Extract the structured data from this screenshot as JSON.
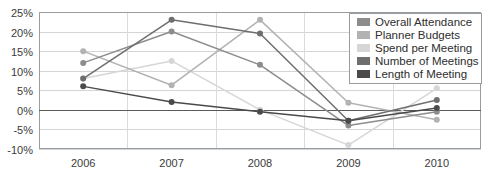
{
  "chart_data": {
    "type": "line",
    "title": "",
    "xlabel": "",
    "ylabel": "",
    "categories": [
      "2006",
      "2007",
      "2008",
      "2009",
      "2010"
    ],
    "ylim": [
      -10,
      25
    ],
    "ytick_labels": [
      "25%",
      "20%",
      "15%",
      "10%",
      "5%",
      "0%",
      "-5%",
      "-10%"
    ],
    "ytick_values": [
      25,
      20,
      15,
      10,
      5,
      0,
      -5,
      -10
    ],
    "grid": true,
    "legend_position": "top-right",
    "series": [
      {
        "name": "Overall Attendance",
        "color": "#8c8c8c",
        "values": [
          12,
          20,
          11.5,
          -4,
          -0.5
        ]
      },
      {
        "name": "Planner Budgets",
        "color": "#b2b2b2",
        "values": [
          15,
          6.3,
          23,
          1.8,
          -2.5
        ]
      },
      {
        "name": "Spend per Meeting",
        "color": "#d6d6d6",
        "values": [
          8,
          12.5,
          0,
          -9,
          5.5
        ]
      },
      {
        "name": "Number of Meetings",
        "color": "#6e6e6e",
        "values": [
          8,
          23,
          19.5,
          -2.8,
          2.5
        ]
      },
      {
        "name": "Length of Meeting",
        "color": "#4a4a4a",
        "values": [
          6,
          2,
          -0.5,
          -2.8,
          0.5
        ]
      }
    ]
  }
}
